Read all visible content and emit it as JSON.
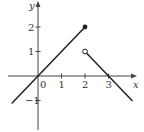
{
  "chart_data": {
    "type": "line",
    "title": "",
    "xlabel": "x",
    "ylabel": "y",
    "xlim": [
      -1.3,
      4.2
    ],
    "ylim": [
      -2.2,
      3.1
    ],
    "grid": false,
    "legend": null,
    "x_ticks": [
      0,
      1,
      2,
      3
    ],
    "x_tick_labels": [
      "0",
      "1",
      "2",
      "3"
    ],
    "y_ticks": [
      -1,
      1,
      2
    ],
    "y_tick_labels": [
      "−1",
      "1",
      "2"
    ],
    "series": [
      {
        "name": "segment-1",
        "x": [
          -1.1,
          2
        ],
        "y": [
          -1.1,
          2
        ],
        "end_marker": {
          "x": 2,
          "y": 2,
          "type": "closed"
        }
      },
      {
        "name": "segment-2",
        "x": [
          2,
          4
        ],
        "y": [
          1,
          -1
        ],
        "start_marker": {
          "x": 2,
          "y": 1,
          "type": "open"
        }
      }
    ],
    "annotations": [
      {
        "type": "closed-dot",
        "x": 2,
        "y": 2
      },
      {
        "type": "open-dot",
        "x": 2,
        "y": 1
      }
    ]
  },
  "colors": {
    "line": "#222222",
    "axis": "#444444",
    "background": "#ffffff"
  },
  "layout": {
    "origin_px": [
      38,
      76
    ],
    "unit_x_px": 23.5,
    "unit_y_px": 24.5
  }
}
